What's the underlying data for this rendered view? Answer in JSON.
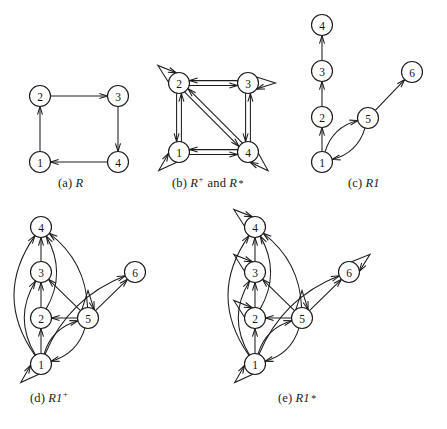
{
  "figure": {
    "background_color": "#ffffff",
    "ink_color": "#1c1c1c",
    "node_radius": 10.5
  },
  "captions": {
    "a": {
      "label": "(a)",
      "relation": "R",
      "exponent": ""
    },
    "b": {
      "label": "(b)",
      "relation": "R",
      "exponent": "+",
      "conjunction": "and",
      "relation2": "R",
      "exponent2": "*"
    },
    "c": {
      "label": "(c)",
      "relation": "R1",
      "exponent": ""
    },
    "d": {
      "label": "(d)",
      "relation": "R1",
      "exponent": "+"
    },
    "e": {
      "label": "(e)",
      "relation": "R1",
      "exponent": "*"
    }
  },
  "panels": [
    {
      "id": "a",
      "caption": "(a) R",
      "nodes": [
        {
          "id": "2",
          "label": "2",
          "x": 40,
          "y": 96
        },
        {
          "id": "3",
          "label": "3",
          "x": 118,
          "y": 96
        },
        {
          "id": "1",
          "label": "1",
          "x": 40,
          "y": 162
        },
        {
          "id": "4",
          "label": "4",
          "x": 118,
          "y": 162
        }
      ],
      "edges": [
        {
          "from": "1",
          "to": "2",
          "kind": "straight"
        },
        {
          "from": "2",
          "to": "3",
          "kind": "straight"
        },
        {
          "from": "3",
          "to": "4",
          "kind": "straight"
        },
        {
          "from": "4",
          "to": "1",
          "kind": "straight"
        }
      ],
      "self_loops": []
    },
    {
      "id": "b",
      "caption": "(b) R+ and R*",
      "nodes": [
        {
          "id": "2",
          "label": "2",
          "x": 179,
          "y": 83
        },
        {
          "id": "3",
          "label": "3",
          "x": 248,
          "y": 83
        },
        {
          "id": "1",
          "label": "1",
          "x": 179,
          "y": 152
        },
        {
          "id": "4",
          "label": "4",
          "x": 248,
          "y": 152
        }
      ],
      "edges": [
        {
          "from": "2",
          "to": "3",
          "kind": "parallel"
        },
        {
          "from": "3",
          "to": "2",
          "kind": "parallel"
        },
        {
          "from": "1",
          "to": "4",
          "kind": "parallel"
        },
        {
          "from": "4",
          "to": "1",
          "kind": "parallel"
        },
        {
          "from": "1",
          "to": "2",
          "kind": "parallel"
        },
        {
          "from": "2",
          "to": "1",
          "kind": "parallel"
        },
        {
          "from": "3",
          "to": "4",
          "kind": "parallel"
        },
        {
          "from": "4",
          "to": "3",
          "kind": "parallel"
        },
        {
          "from": "2",
          "to": "4",
          "kind": "parallel-diagonal"
        },
        {
          "from": "4",
          "to": "2",
          "kind": "parallel-diagonal"
        }
      ],
      "self_loops": [
        {
          "node": "2",
          "direction": "up-left"
        },
        {
          "node": "3",
          "direction": "right"
        },
        {
          "node": "1",
          "direction": "down-left"
        },
        {
          "node": "4",
          "direction": "down-right"
        }
      ]
    },
    {
      "id": "c",
      "caption": "(c) R1",
      "nodes": [
        {
          "id": "4",
          "label": "4",
          "x": 322,
          "y": 25
        },
        {
          "id": "3",
          "label": "3",
          "x": 322,
          "y": 71
        },
        {
          "id": "2",
          "label": "2",
          "x": 322,
          "y": 117
        },
        {
          "id": "1",
          "label": "1",
          "x": 322,
          "y": 162
        },
        {
          "id": "5",
          "label": "5",
          "x": 368,
          "y": 118
        },
        {
          "id": "6",
          "label": "6",
          "x": 412,
          "y": 72
        }
      ],
      "edges": [
        {
          "from": "1",
          "to": "2",
          "kind": "straight"
        },
        {
          "from": "2",
          "to": "3",
          "kind": "straight"
        },
        {
          "from": "3",
          "to": "4",
          "kind": "straight"
        },
        {
          "from": "1",
          "to": "5",
          "kind": "curve",
          "bow": -9
        },
        {
          "from": "5",
          "to": "1",
          "kind": "curve",
          "bow": -9
        },
        {
          "from": "5",
          "to": "6",
          "kind": "straight"
        }
      ],
      "self_loops": []
    },
    {
      "id": "d",
      "caption": "(d) R1+",
      "nodes": [
        {
          "id": "4",
          "label": "4",
          "x": 41,
          "y": 227
        },
        {
          "id": "3",
          "label": "3",
          "x": 41,
          "y": 272
        },
        {
          "id": "2",
          "label": "2",
          "x": 41,
          "y": 318
        },
        {
          "id": "1",
          "label": "1",
          "x": 41,
          "y": 364
        },
        {
          "id": "5",
          "label": "5",
          "x": 88,
          "y": 318
        },
        {
          "id": "6",
          "label": "6",
          "x": 135,
          "y": 272
        }
      ],
      "edges": [
        {
          "from": "1",
          "to": "2",
          "kind": "straight"
        },
        {
          "from": "2",
          "to": "3",
          "kind": "straight"
        },
        {
          "from": "3",
          "to": "4",
          "kind": "straight"
        },
        {
          "from": "1",
          "to": "3",
          "kind": "curve",
          "bow": -14
        },
        {
          "from": "2",
          "to": "4",
          "kind": "curve",
          "bow": 13
        },
        {
          "from": "1",
          "to": "4",
          "kind": "curve",
          "bow": -24
        },
        {
          "from": "1",
          "to": "5",
          "kind": "curve",
          "bow": -9
        },
        {
          "from": "5",
          "to": "1",
          "kind": "curve",
          "bow": -9
        },
        {
          "from": "5",
          "to": "2",
          "kind": "straight"
        },
        {
          "from": "5",
          "to": "3",
          "kind": "straight"
        },
        {
          "from": "5",
          "to": "4",
          "kind": "curve",
          "bow": 12
        },
        {
          "from": "5",
          "to": "6",
          "kind": "straight"
        },
        {
          "from": "1",
          "to": "6",
          "kind": "curve",
          "bow": -14
        }
      ],
      "self_loops": [
        {
          "node": "1",
          "direction": "down-left"
        },
        {
          "node": "5",
          "direction": "up"
        }
      ]
    },
    {
      "id": "e",
      "caption": "(e) R1*",
      "nodes": [
        {
          "id": "4",
          "label": "4",
          "x": 255,
          "y": 227
        },
        {
          "id": "3",
          "label": "3",
          "x": 255,
          "y": 272
        },
        {
          "id": "2",
          "label": "2",
          "x": 255,
          "y": 318
        },
        {
          "id": "1",
          "label": "1",
          "x": 255,
          "y": 364
        },
        {
          "id": "5",
          "label": "5",
          "x": 302,
          "y": 318
        },
        {
          "id": "6",
          "label": "6",
          "x": 349,
          "y": 272
        }
      ],
      "edges": [
        {
          "from": "1",
          "to": "2",
          "kind": "straight"
        },
        {
          "from": "2",
          "to": "3",
          "kind": "straight"
        },
        {
          "from": "3",
          "to": "4",
          "kind": "straight"
        },
        {
          "from": "1",
          "to": "3",
          "kind": "curve",
          "bow": -14
        },
        {
          "from": "2",
          "to": "4",
          "kind": "curve",
          "bow": 13
        },
        {
          "from": "1",
          "to": "4",
          "kind": "curve",
          "bow": -24
        },
        {
          "from": "1",
          "to": "5",
          "kind": "curve",
          "bow": -9
        },
        {
          "from": "5",
          "to": "1",
          "kind": "curve",
          "bow": -9
        },
        {
          "from": "5",
          "to": "2",
          "kind": "straight"
        },
        {
          "from": "5",
          "to": "3",
          "kind": "straight"
        },
        {
          "from": "5",
          "to": "4",
          "kind": "curve",
          "bow": 12
        },
        {
          "from": "5",
          "to": "6",
          "kind": "straight"
        },
        {
          "from": "1",
          "to": "6",
          "kind": "curve",
          "bow": -14
        }
      ],
      "self_loops": [
        {
          "node": "1",
          "direction": "down-left"
        },
        {
          "node": "2",
          "direction": "up-left"
        },
        {
          "node": "3",
          "direction": "up-left"
        },
        {
          "node": "4",
          "direction": "up-left"
        },
        {
          "node": "5",
          "direction": "up"
        },
        {
          "node": "6",
          "direction": "up-right"
        }
      ]
    }
  ]
}
